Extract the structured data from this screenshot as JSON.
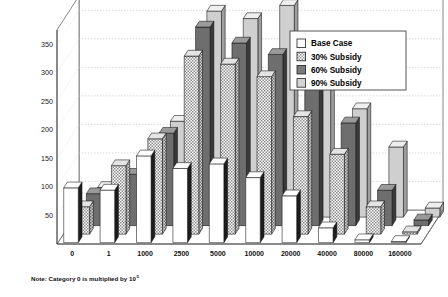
{
  "chart_data": {
    "type": "bar",
    "title": "",
    "subtitle": "",
    "xlabel": "",
    "ylabel": "",
    "ylim": [
      0,
      375
    ],
    "yticks": [
      50,
      100,
      150,
      200,
      250,
      300,
      350
    ],
    "grid": true,
    "projection": "3d-clustered-column",
    "legend_position": "top-right",
    "categories": [
      "0",
      "1",
      "1000",
      "2500",
      "5000",
      "10000",
      "20000",
      "40000",
      "80000",
      "160000"
    ],
    "series": [
      {
        "name": "Base Case",
        "pattern": "solid-white",
        "color": "#ffffff",
        "values": [
          96,
          92,
          152,
          130,
          138,
          114,
          82,
          26,
          5,
          2
        ]
      },
      {
        "name": "30% Subsidy",
        "pattern": "hatch-diagonal",
        "color": "#b8b8b8",
        "values": [
          48,
          120,
          167,
          312,
          298,
          276,
          206,
          140,
          48,
          4
        ]
      },
      {
        "name": "60% Subsidy",
        "pattern": "solid-dark-gray",
        "color": "#6e6e6e",
        "values": [
          56,
          90,
          162,
          348,
          320,
          300,
          259,
          180,
          62,
          10
        ]
      },
      {
        "name": "90% Subsidy",
        "pattern": "solid-light-gray",
        "color": "#cfcfcf",
        "values": [
          52,
          68,
          168,
          361,
          348,
          371,
          272,
          190,
          123,
          16
        ]
      }
    ],
    "note": {
      "text": "Note: Category 0 is multiplied by 10",
      "superscript": "5"
    }
  },
  "legend": {
    "entries": [
      {
        "label": "Base Case",
        "swatch": "swatch-white"
      },
      {
        "label": "30% Subsidy",
        "swatch": "swatch-hatch"
      },
      {
        "label": "60% Subsidy",
        "swatch": "swatch-dark"
      },
      {
        "label": "90% Subsidy",
        "swatch": "swatch-light"
      }
    ]
  }
}
